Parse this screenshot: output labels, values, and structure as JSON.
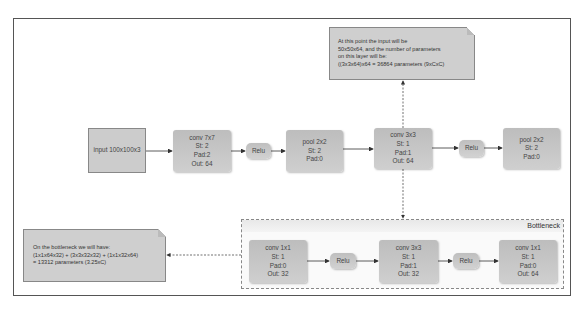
{
  "frame": {
    "border_color": "#555555"
  },
  "main_flow": {
    "input": {
      "label": "input 100x100x3"
    },
    "conv7x7": {
      "lines": [
        "conv 7x7",
        "St: 2",
        "Pad:2",
        "Out: 64"
      ]
    },
    "relu1": {
      "label": "Relu"
    },
    "pool1": {
      "lines": [
        "pool 2x2",
        "St: 2",
        "Pad:0"
      ]
    },
    "conv3x3": {
      "lines": [
        "conv 3x3",
        "St: 1",
        "Pad:1",
        "Out: 64"
      ]
    },
    "relu2": {
      "label": "Relu"
    },
    "pool2": {
      "lines": [
        "pool 2x2",
        "St: 2",
        "Pad:0"
      ]
    }
  },
  "top_note": {
    "lines": [
      "At this point the input will be",
      "50x50x64, and the number of parameters",
      "on this layer will be:",
      "((3x3x64)x64 = 36864 parameters (9xCxC)"
    ]
  },
  "bottleneck": {
    "title": "Bottleneck",
    "conv1x1_a": {
      "lines": [
        "conv 1x1",
        "St: 1",
        "Pad:0",
        "Out: 32"
      ]
    },
    "relu_a": {
      "label": "Relu"
    },
    "conv3x3": {
      "lines": [
        "conv 3x3",
        "St: 1",
        "Pad:1",
        "Out: 32"
      ]
    },
    "relu_b": {
      "label": "Relu"
    },
    "conv1x1_b": {
      "lines": [
        "conv 1x1",
        "St: 1",
        "Pad:0",
        "Out: 64"
      ]
    }
  },
  "bottleneck_note": {
    "lines": [
      "On the bottleneck we will have:",
      "(1x1x64x32) + (3x3x32x32) + (1x1x32x64)",
      "= 13312 parameters (3.25xC)"
    ]
  },
  "colors": {
    "node_fill": "#c6c6c6",
    "note_fill": "#cfcfcf",
    "line": "#333333"
  }
}
